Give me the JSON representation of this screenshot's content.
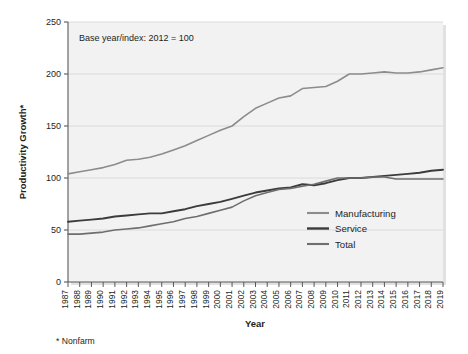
{
  "chart_data": {
    "type": "line",
    "title": "",
    "xlabel": "Year",
    "ylabel": "Productivity Growth*",
    "annotation": "Base year/index: 2012 = 100",
    "footnote": "* Nonfarm",
    "grid": true,
    "legend_position": "inside-right",
    "ylim": [
      0,
      250
    ],
    "yticks": [
      0,
      50,
      100,
      150,
      200,
      250
    ],
    "ytick_labels": [
      "0",
      "50",
      "100",
      "150",
      "200",
      "250"
    ],
    "xlim": [
      1987,
      2019
    ],
    "categories": [
      "1987",
      "1988",
      "1989",
      "1990",
      "1991",
      "1992",
      "1993",
      "1994",
      "1995",
      "1996",
      "1997",
      "1998",
      "1999",
      "2000",
      "2001",
      "2002",
      "2003",
      "2004",
      "2005",
      "2006",
      "2007",
      "2008",
      "2009",
      "2010",
      "2011",
      "2012",
      "2013",
      "2014",
      "2015",
      "2016",
      "2017",
      "2018",
      "2019"
    ],
    "series": [
      {
        "name": "Manufacturing",
        "color": "#8c8c8c",
        "width": 1.6,
        "values": [
          104,
          106,
          108,
          110,
          113,
          117,
          118,
          120,
          123,
          127,
          131,
          136,
          141,
          146,
          150,
          159,
          167,
          172,
          177,
          179,
          186,
          187,
          188,
          193,
          200,
          200,
          201,
          202,
          201,
          201,
          202,
          204,
          206
        ]
      },
      {
        "name": "Service",
        "color": "#3b3b3b",
        "width": 1.9,
        "values": [
          58,
          59,
          60,
          61,
          63,
          64,
          65,
          66,
          66,
          68,
          70,
          73,
          75,
          77,
          80,
          83,
          86,
          88,
          90,
          91,
          94,
          93,
          95,
          98,
          100,
          100,
          101,
          102,
          103,
          104,
          105,
          107,
          108
        ]
      },
      {
        "name": "Total",
        "color": "#6e6e6e",
        "width": 1.6,
        "values": [
          46,
          46,
          47,
          48,
          50,
          51,
          52,
          54,
          56,
          58,
          61,
          63,
          66,
          69,
          72,
          78,
          83,
          86,
          89,
          90,
          92,
          94,
          97,
          100,
          100,
          100,
          101,
          101,
          99,
          99,
          99,
          99,
          99
        ]
      }
    ]
  },
  "legend": {
    "items": [
      {
        "label": "Manufacturing"
      },
      {
        "label": "Service"
      },
      {
        "label": "Total"
      }
    ]
  },
  "colors": {
    "plot_background": "#f2f2f2",
    "grid": "#d8d8d8",
    "axis": "#58595b",
    "page_background": "#ffffff"
  }
}
